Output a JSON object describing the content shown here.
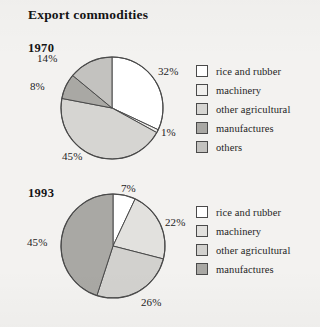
{
  "title": "Export commodities",
  "colors": {
    "background": "#f3f2f0",
    "outline": "#4a4a4a",
    "text": "#1a1a1a",
    "rice_and_rubber": "#ffffff",
    "machinery": "#f0efed",
    "other_agricultural": "#d6d5d2",
    "manufactures": "#a9a8a4",
    "others": "#c3c2bf"
  },
  "charts": [
    {
      "year_label": "1970",
      "labels": {
        "rice_and_rubber": "32%",
        "machinery": "1%",
        "other_agricultural": "45%",
        "manufactures": "8%",
        "others": "14%"
      },
      "legend": [
        {
          "label": "rice and rubber",
          "swatch": "#ffffff"
        },
        {
          "label": "machinery",
          "swatch": "#f0efed"
        },
        {
          "label": "other agricultural",
          "swatch": "#d6d5d2"
        },
        {
          "label": "manufactures",
          "swatch": "#a9a8a4"
        },
        {
          "label": "others",
          "swatch": "#c3c2bf"
        }
      ]
    },
    {
      "year_label": "1993",
      "labels": {
        "rice_and_rubber": "7%",
        "machinery": "22%",
        "other_agricultural": "26%",
        "manufactures": "45%"
      },
      "legend": [
        {
          "label": "rice and rubber",
          "swatch": "#ffffff"
        },
        {
          "label": "machinery",
          "swatch": "#e2e1de"
        },
        {
          "label": "other agricultural",
          "swatch": "#d2d1ce"
        },
        {
          "label": "manufactures",
          "swatch": "#a9a8a4"
        }
      ]
    }
  ],
  "chart_data": [
    {
      "type": "pie",
      "title": "Export commodities",
      "subtitle": "1970",
      "categories": [
        "rice and rubber",
        "machinery",
        "other agricultural",
        "manufactures",
        "others"
      ],
      "values": [
        32,
        1,
        45,
        8,
        14
      ],
      "value_labels": [
        "32%",
        "1%",
        "45%",
        "8%",
        "14%"
      ],
      "unit": "percent",
      "start_angle_deg": 0,
      "direction": "clockwise",
      "legend_position": "right",
      "grid": false,
      "xlabel": "",
      "ylabel": ""
    },
    {
      "type": "pie",
      "title": "Export commodities",
      "subtitle": "1993",
      "categories": [
        "rice and rubber",
        "machinery",
        "other agricultural",
        "manufactures"
      ],
      "values": [
        7,
        22,
        26,
        45
      ],
      "value_labels": [
        "7%",
        "22%",
        "26%",
        "45%"
      ],
      "unit": "percent",
      "start_angle_deg": 0,
      "direction": "clockwise",
      "legend_position": "right",
      "grid": false,
      "xlabel": "",
      "ylabel": ""
    }
  ]
}
